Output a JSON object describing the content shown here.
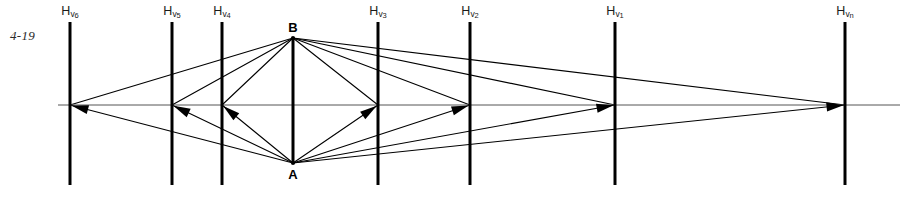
{
  "figure": {
    "number": "4-19",
    "type": "perspective-construction-diagram",
    "width": 921,
    "height": 199,
    "background_color": "#ffffff",
    "ink_color": "#000000",
    "horizon_color": "#555555"
  },
  "horizon": {
    "name": "horizon-line",
    "y": 105,
    "x_start": 58,
    "x_end": 900,
    "stroke_width": 1
  },
  "points": [
    {
      "id": "B",
      "label": "B",
      "x": 293,
      "y": 38,
      "label_x": 293,
      "label_y": 21
    },
    {
      "id": "A",
      "label": "A",
      "x": 293,
      "y": 163,
      "label_x": 293,
      "label_y": 168
    }
  ],
  "subject_line": {
    "name": "vertical-object-line-AB",
    "x": 293,
    "y_top": 38,
    "y_bottom": 163,
    "stroke_width": 3
  },
  "vanishing_lines": [
    {
      "id": "hv6",
      "label_html": "H<span class=\"sub\">v</span><span class=\"sub2\">6</span>",
      "label_text": "Hv6",
      "x": 70,
      "y_top": 22,
      "y_bottom": 185,
      "label_x": 70,
      "label_y": 5,
      "vp_y": 105,
      "stroke_width": 3
    },
    {
      "id": "hv5",
      "label_html": "H<span class=\"sub\">v</span><span class=\"sub2\">5</span>",
      "label_text": "Hv5",
      "x": 172,
      "y_top": 22,
      "y_bottom": 185,
      "label_x": 172,
      "label_y": 5,
      "vp_y": 105,
      "stroke_width": 3
    },
    {
      "id": "hv4",
      "label_html": "H<span class=\"sub\">v</span><span class=\"sub2\">4</span>",
      "label_text": "Hv4",
      "x": 222,
      "y_top": 22,
      "y_bottom": 185,
      "label_x": 222,
      "label_y": 5,
      "vp_y": 105,
      "stroke_width": 3
    },
    {
      "id": "hv3",
      "label_html": "H<span class=\"sub\">v</span><span class=\"sub2\">3</span>",
      "label_text": "Hv3",
      "x": 378,
      "y_top": 22,
      "y_bottom": 185,
      "label_x": 378,
      "label_y": 5,
      "vp_y": 105,
      "stroke_width": 3
    },
    {
      "id": "hv2",
      "label_html": "H<span class=\"sub\">v</span><span class=\"sub2\">2</span>",
      "label_text": "Hv2",
      "x": 470,
      "y_top": 22,
      "y_bottom": 185,
      "label_x": 470,
      "label_y": 5,
      "vp_y": 105,
      "stroke_width": 3
    },
    {
      "id": "hv1",
      "label_html": "H<span class=\"sub\">v</span><span class=\"sub2\">1</span>",
      "label_text": "Hv1",
      "x": 615,
      "y_top": 22,
      "y_bottom": 185,
      "label_x": 615,
      "label_y": 5,
      "vp_y": 105,
      "stroke_width": 3
    },
    {
      "id": "hvn",
      "label_html": "H<span class=\"sub\">v</span><span class=\"sub2\">n</span>",
      "label_text": "Hvn",
      "x": 845,
      "y_top": 22,
      "y_bottom": 185,
      "label_x": 845,
      "label_y": 5,
      "vp_y": 105,
      "stroke_width": 3
    }
  ],
  "rays": [
    {
      "from": "B",
      "to": "hv6",
      "x1": 293,
      "y1": 38,
      "x2": 70,
      "y2": 105,
      "arrow": false
    },
    {
      "from": "B",
      "to": "hv5",
      "x1": 293,
      "y1": 38,
      "x2": 172,
      "y2": 105,
      "arrow": false
    },
    {
      "from": "B",
      "to": "hv4",
      "x1": 293,
      "y1": 38,
      "x2": 222,
      "y2": 105,
      "arrow": false
    },
    {
      "from": "B",
      "to": "hv3",
      "x1": 293,
      "y1": 38,
      "x2": 378,
      "y2": 105,
      "arrow": false
    },
    {
      "from": "B",
      "to": "hv2",
      "x1": 293,
      "y1": 38,
      "x2": 470,
      "y2": 105,
      "arrow": false
    },
    {
      "from": "B",
      "to": "hv1",
      "x1": 293,
      "y1": 38,
      "x2": 615,
      "y2": 105,
      "arrow": false
    },
    {
      "from": "B",
      "to": "hvn",
      "x1": 293,
      "y1": 38,
      "x2": 845,
      "y2": 105,
      "arrow": false
    },
    {
      "from": "A",
      "to": "hv6",
      "x1": 293,
      "y1": 163,
      "x2": 70,
      "y2": 105,
      "arrow": true
    },
    {
      "from": "A",
      "to": "hv5",
      "x1": 293,
      "y1": 163,
      "x2": 172,
      "y2": 105,
      "arrow": true
    },
    {
      "from": "A",
      "to": "hv4",
      "x1": 293,
      "y1": 163,
      "x2": 222,
      "y2": 105,
      "arrow": true
    },
    {
      "from": "A",
      "to": "hv3",
      "x1": 293,
      "y1": 163,
      "x2": 378,
      "y2": 105,
      "arrow": true
    },
    {
      "from": "A",
      "to": "hv2",
      "x1": 293,
      "y1": 163,
      "x2": 470,
      "y2": 105,
      "arrow": true
    },
    {
      "from": "A",
      "to": "hv1",
      "x1": 293,
      "y1": 163,
      "x2": 615,
      "y2": 105,
      "arrow": true
    },
    {
      "from": "A",
      "to": "hvn",
      "x1": 293,
      "y1": 163,
      "x2": 845,
      "y2": 105,
      "arrow": true
    }
  ]
}
